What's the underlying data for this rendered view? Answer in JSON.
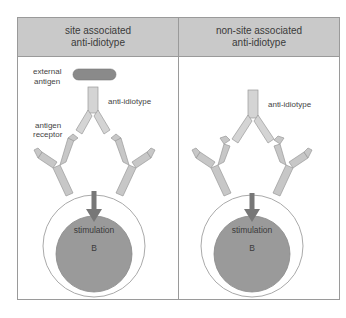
{
  "panels": [
    {
      "title_line1": "site associated",
      "title_line2": "anti-idiotype",
      "labels": {
        "external_antigen_1": "external",
        "external_antigen_2": "antigen",
        "anti_idiotype": "anti-idiotype",
        "antigen_receptor_1": "antigen",
        "antigen_receptor_2": "receptor",
        "stimulation": "stimulation",
        "cell": "B"
      }
    },
    {
      "title_line1": "non-site associated",
      "title_line2": "anti-idiotype",
      "labels": {
        "anti_idiotype": "anti-idiotype",
        "stimulation": "stimulation",
        "cell": "B"
      }
    }
  ],
  "colors": {
    "header_bg": "#c9c9c9",
    "antibody_fill": "#cfcfcf",
    "antigen_fill": "#8a8a8a",
    "nucleus_fill": "#999999",
    "arrow_fill": "#777777"
  }
}
